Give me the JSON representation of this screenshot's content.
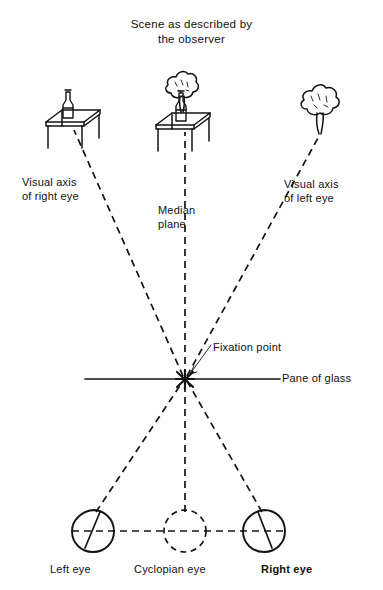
{
  "figure": {
    "title": "Scene as described by\nthe observer",
    "background_color": "#fefefe",
    "ink_color": "#131313",
    "labels": {
      "visual_axis_right": "Visual axis\nof right eye",
      "median_plane": "Median\nplane",
      "visual_axis_left": "Visual axis\nof left eye",
      "fixation_point": "Fixation point",
      "pane_of_glass": "Pane of glass",
      "left_eye": "Left eye",
      "cyclopian_eye": "Cyclopian eye",
      "right_eye": "Right eye"
    },
    "objects": {
      "left_scene": "table-with-bottle",
      "center_scene": "tree-behind-table-with-bottle",
      "right_scene": "tree"
    },
    "geometry": {
      "fixation_point_xy": [
        185,
        379
      ],
      "pane_line_y": 379,
      "pane_line_x_start": 85,
      "pane_line_x_end": 280,
      "left_eye_xy": [
        93,
        531
      ],
      "cyclopian_eye_xy": [
        185,
        531
      ],
      "right_eye_xy": [
        264,
        531
      ],
      "eye_radius": 21
    }
  }
}
